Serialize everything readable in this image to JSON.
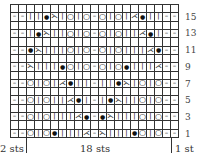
{
  "chart": {
    "columns": 21,
    "rows_total": 16,
    "symbol_map": {
      "-": "purl",
      "|": "knit",
      "O": "yarn-over",
      "•": "bobble",
      "<": "k2tog",
      ">": "ssk",
      " ": "blank"
    },
    "glyphs": {
      "-": "–",
      "|": "|",
      "O": "○",
      "•": "●",
      "<": "⋌",
      "> ": "⋋",
      ">": "⋋",
      " ": ""
    },
    "rows": [
      {
        "num": "16",
        "label": "",
        "cells": "                     "
      },
      {
        "num": "15",
        "label": "15",
        "cells": "--||•>|O|O-O|O|<•||--"
      },
      {
        "num": "14",
        "label": "",
        "cells": "                     "
      },
      {
        "num": "13",
        "label": "13",
        "cells": "--|•>||O|O-O|O||<•|--"
      },
      {
        "num": "12",
        "label": "",
        "cells": "                     "
      },
      {
        "num": "11",
        "label": "11",
        "cells": "--•>|||O|O-O|O|||<•--"
      },
      {
        "num": "10",
        "label": "",
        "cells": "                     "
      },
      {
        "num": "9",
        "label": "9",
        "cells": "-->|||•O|O-O|O•|||<--"
      },
      {
        "num": "8",
        "label": "",
        "cells": "                     "
      },
      {
        "num": "7",
        "label": "7",
        "cells": "--O|O|<•||-||•>|O|O--"
      },
      {
        "num": "6",
        "label": "",
        "cells": "                     "
      },
      {
        "num": "5",
        "label": "5",
        "cells": "--O|O||<•|-|•>||O|O--"
      },
      {
        "num": "4",
        "label": "",
        "cells": "                     "
      },
      {
        "num": "3",
        "label": "3",
        "cells": "--O|O|||<•-•>|||O|O--"
      },
      {
        "num": "2",
        "label": "",
        "cells": "                     "
      },
      {
        "num": "1",
        "label": "1",
        "cells": "--O|O•|||<->|||•O|O--"
      }
    ]
  },
  "footer": {
    "left_label": "2 sts",
    "center_label": "18 sts",
    "right_label": "1 st"
  }
}
